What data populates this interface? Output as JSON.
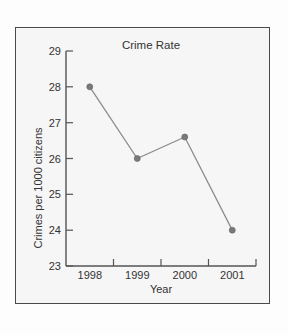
{
  "chart_data": {
    "type": "line",
    "title": "Crime Rate",
    "xlabel": "Year",
    "ylabel": "Crimes per 1000 citizens",
    "categories": [
      "1998",
      "1999",
      "2000",
      "2001"
    ],
    "values": [
      28,
      26,
      26.6,
      24
    ],
    "series": [
      {
        "name": "Crime Rate",
        "values": [
          28,
          26,
          26.6,
          24
        ]
      }
    ],
    "ylim": [
      23,
      29
    ],
    "yticks": [
      23,
      24,
      25,
      26,
      27,
      28,
      29
    ],
    "ytick_labels": [
      "23",
      "24",
      "25",
      "26",
      "27",
      "28",
      "29"
    ],
    "xtick_labels": [
      "1998",
      "1999",
      "2000",
      "2001"
    ],
    "grid": false,
    "legend": false,
    "legend_position": "none",
    "marker": "circle",
    "line_color": "#8c8c8c",
    "marker_color": "#7a7a7a",
    "axis_color": "#555555",
    "text_color": "#333333",
    "frame_color": "#4a4a4a",
    "plot_background": "#f6f6f6"
  }
}
